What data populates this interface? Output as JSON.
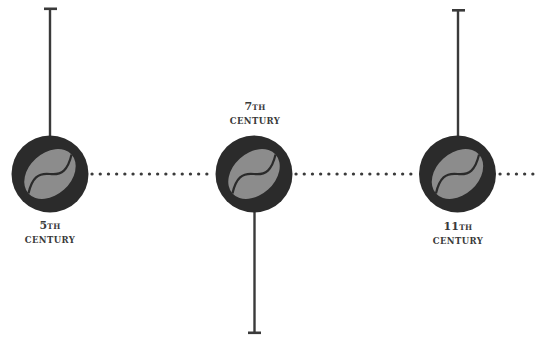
{
  "diagram": {
    "type": "timeline",
    "colors": {
      "circle": "#2b2b2b",
      "bean": "#8c8c8c",
      "bean_crease": "#2b2b2b",
      "stem": "#3a3a3a",
      "dots": "#3a3a3a",
      "label": "#3a3a3a",
      "background": "#ffffff"
    },
    "icon": "coffee-bean-icon",
    "events": [
      {
        "id": "event-5th-century",
        "number": "5",
        "suffix": "TH",
        "word": "CENTURY",
        "stem_direction": "up"
      },
      {
        "id": "event-7th-century",
        "number": "7",
        "suffix": "TH",
        "word": "CENTURY",
        "stem_direction": "down"
      },
      {
        "id": "event-11th-century",
        "number": "11",
        "suffix": "TH",
        "word": "CENTURY",
        "stem_direction": "up"
      }
    ]
  }
}
